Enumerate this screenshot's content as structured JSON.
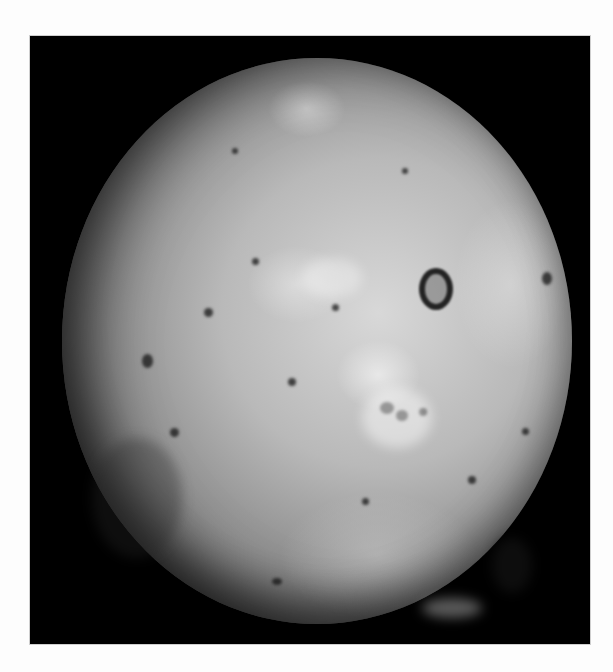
{
  "image": {
    "subject": "Io",
    "description": "Grayscale photograph of Jupiter's moon Io against a black background",
    "colors": {
      "page_background": "#fdfdfd",
      "frame_background": "#000000",
      "surface_light": "#d8d8d8",
      "surface_mid": "#b9b9b9",
      "surface_dark": "#5a5a5a"
    }
  }
}
